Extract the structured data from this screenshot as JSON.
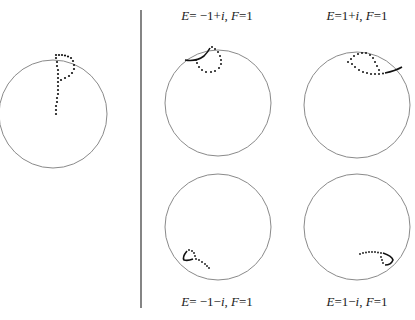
{
  "figure": {
    "divider": {
      "x": 141,
      "y1": 10,
      "y2": 308,
      "color": "#333333"
    },
    "circle_color": "#8a8a8a",
    "dot_color": "#111111",
    "panels": [
      {
        "id": "initial",
        "label": null,
        "center": [
          53,
          114
        ],
        "radius": 54,
        "shape": "P-shaped dotted curve"
      },
      {
        "id": "top-middle",
        "label": {
          "E": "−1+i",
          "F": "1",
          "text": "E= −1+i, F=1"
        },
        "label_pos": [
          210,
          14
        ],
        "center": [
          210,
          103
        ],
        "radius": 53
      },
      {
        "id": "top-right",
        "label": {
          "E": "1+i",
          "F": "1",
          "text": "E=1+i, F=1"
        },
        "label_pos": [
          356,
          14
        ],
        "center": [
          357,
          105
        ],
        "radius": 53
      },
      {
        "id": "bottom-middle",
        "label": {
          "E": "−1−i",
          "F": "1",
          "text": "E= −1−i, F=1"
        },
        "label_pos": [
          210,
          300
        ],
        "center": [
          210,
          227
        ],
        "radius": 53
      },
      {
        "id": "bottom-right",
        "label": {
          "E": "1−i",
          "F": "1",
          "text": "E=1−i, F=1"
        },
        "label_pos": [
          356,
          300
        ],
        "center": [
          357,
          227
        ],
        "radius": 53
      }
    ]
  },
  "labels": {
    "top_middle": {
      "e_sym": "E",
      "e_val": "= −1+",
      "e_i": "i",
      "sep": ", ",
      "f_sym": "F",
      "f_val": "=1"
    },
    "top_right": {
      "e_sym": "E",
      "e_val": "=1+",
      "e_i": "i",
      "sep": ", ",
      "f_sym": "F",
      "f_val": "=1"
    },
    "bottom_middle": {
      "e_sym": "E",
      "e_val": "= −1−",
      "e_i": "i",
      "sep": ", ",
      "f_sym": "F",
      "f_val": "=1"
    },
    "bottom_right": {
      "e_sym": "E",
      "e_val": "=1−",
      "e_i": "i",
      "sep": ", ",
      "f_sym": "F",
      "f_val": "=1"
    }
  }
}
